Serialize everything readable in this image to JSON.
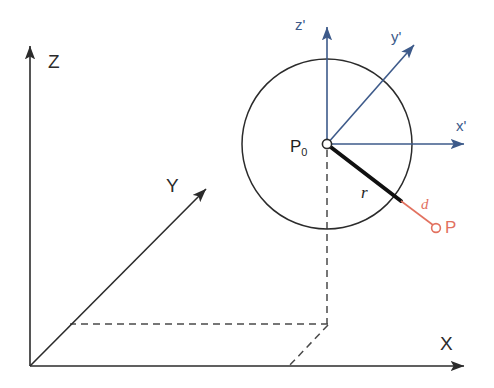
{
  "figure": {
    "background_color": "#ffffff",
    "width": 494,
    "height": 388
  },
  "colors": {
    "global_axis": "#2b2b2b",
    "local_axis": "#3d5a8a",
    "radius_line": "#101010",
    "point_marker": "#e2715f",
    "dashed_construction": "#4a4a4a",
    "circle_outline": "#2b2b2b"
  },
  "global_frame": {
    "origin": {
      "x": 30,
      "y": 366
    },
    "axes": [
      {
        "name": "z-axis",
        "label": "Z",
        "label_x": 48,
        "label_y": 52,
        "tip_x": 30,
        "tip_y": 42,
        "from_x": 30,
        "from_y": 366
      },
      {
        "name": "y-axis",
        "label": "Y",
        "label_x": 166,
        "label_y": 176,
        "tip_x": 209,
        "tip_y": 186,
        "from_x": 30,
        "from_y": 366
      },
      {
        "name": "x-axis",
        "label": "X",
        "label_x": 440,
        "label_y": 334,
        "tip_x": 470,
        "tip_y": 366,
        "from_x": 30,
        "from_y": 366
      }
    ]
  },
  "local_frame": {
    "origin_label": "P",
    "origin_subscript": "0",
    "origin_label_x": 290,
    "origin_label_y": 140,
    "center": {
      "x": 327,
      "y": 144
    },
    "axes": [
      {
        "name": "z-prime-axis",
        "label": "z'",
        "label_x": 295,
        "label_y": 17,
        "tip_x": 327,
        "tip_y": 22
      },
      {
        "name": "y-prime-axis",
        "label": "y'",
        "label_x": 391,
        "label_y": 29,
        "tip_x": 418,
        "tip_y": 40
      },
      {
        "name": "x-prime-axis",
        "label": "x'",
        "label_x": 456,
        "label_y": 118,
        "tip_x": 470,
        "tip_y": 144
      }
    ]
  },
  "sphere": {
    "name": "sphere-outline",
    "center_x": 327,
    "center_y": 144,
    "radius": 85
  },
  "radius_segment": {
    "label": "r",
    "label_x": 361,
    "label_y": 184,
    "from_x": 327,
    "from_y": 144,
    "to_x": 401,
    "to_y": 201
  },
  "distance_segment": {
    "label": "d",
    "label_x": 421,
    "label_y": 197,
    "from_x": 401,
    "from_y": 201,
    "to_x": 434,
    "to_y": 226
  },
  "outer_point": {
    "label": "P",
    "label_x": 445,
    "label_y": 220,
    "marker_x": 436,
    "marker_y": 228,
    "marker_radius": 4
  },
  "construction": {
    "name": "dashed-projection-lines",
    "vertical_from": {
      "x": 327,
      "y": 144
    },
    "vertical_to": {
      "x": 327,
      "y": 324
    },
    "horizontal_from": {
      "x": 327,
      "y": 324
    },
    "horizontal_to": {
      "x": 70,
      "y": 324
    },
    "diagonal_from": {
      "x": 327,
      "y": 324
    },
    "diagonal_to": {
      "x": 290,
      "y": 366
    }
  }
}
